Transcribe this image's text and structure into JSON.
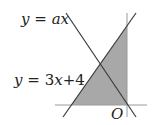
{
  "figure": {
    "labels": {
      "line1_lhs": "y",
      "line1_eq": "=",
      "line1_rhs": "ax",
      "line2_lhs": "y",
      "line2_eq": "=",
      "line2_rhs_coef": "3",
      "line2_rhs_var": "x",
      "line2_rhs_const": "+4",
      "origin": "O"
    },
    "colors": {
      "shade": "#a8a8a8",
      "line": "#3a3a3a",
      "axis": "#9a9a9a"
    }
  }
}
